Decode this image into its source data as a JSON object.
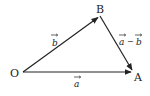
{
  "diagram": {
    "points": {
      "O": {
        "label": "O",
        "x": 23,
        "y": 72
      },
      "A": {
        "label": "A",
        "x": 133,
        "y": 72
      },
      "B": {
        "label": "B",
        "x": 100,
        "y": 16
      }
    },
    "vectors": [
      {
        "from": "O",
        "to": "A",
        "label": "a"
      },
      {
        "from": "O",
        "to": "B",
        "label": "b"
      },
      {
        "from": "B",
        "to": "A",
        "label_left": "a",
        "label_op": "−",
        "label_right": "b"
      }
    ],
    "colors": {
      "stroke": "#222222",
      "text": "#222222"
    }
  }
}
